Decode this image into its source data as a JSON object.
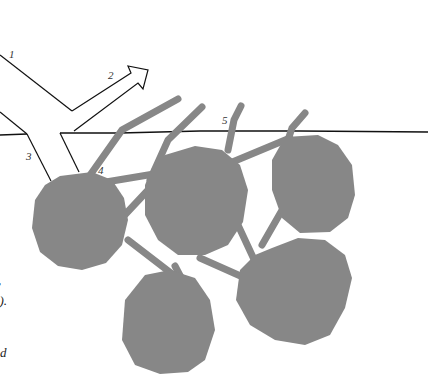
{
  "diagram": {
    "colors": {
      "background": "#ffffff",
      "line": "#111111",
      "particle": "#878787",
      "label": "#333333"
    },
    "labels": [
      {
        "id": "1",
        "text": "1",
        "meaning": "incident ray"
      },
      {
        "id": "2",
        "text": "2",
        "meaning": "reflected ray (arrow)"
      },
      {
        "id": "3",
        "text": "3",
        "meaning": "refracted beam"
      },
      {
        "id": "4",
        "text": "4",
        "meaning": "particle contact"
      },
      {
        "id": "5",
        "text": "5",
        "meaning": "interface"
      }
    ],
    "caption_fragments": [
      {
        "text": ",",
        "position": "left-edge"
      },
      {
        "text": "o).",
        "position": "left-edge"
      },
      {
        "text": "d",
        "position": "left-edge"
      }
    ]
  }
}
